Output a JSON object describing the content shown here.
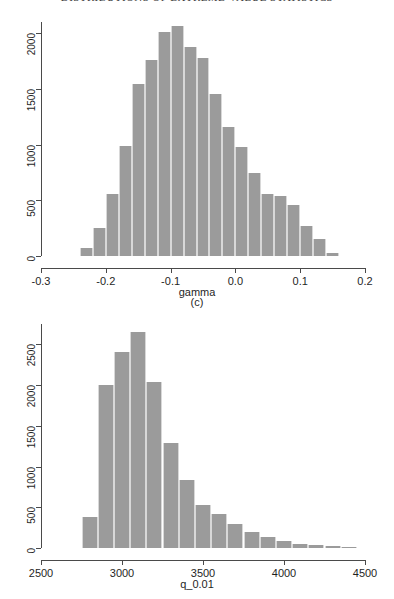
{
  "page": {
    "running_head": "DISTRIBUTIONS OF EXTREME-VALUE STATISTICS"
  },
  "panels": [
    {
      "name": "panel-gamma",
      "caption": "(c)"
    }
  ],
  "chart_data": [
    {
      "type": "bar",
      "subtype": "histogram",
      "title": "",
      "xlabel": "gamma",
      "ylabel": "",
      "xlim": [
        -0.3,
        0.2
      ],
      "ylim": [
        0,
        2100
      ],
      "xticks": [
        -0.3,
        -0.2,
        -0.1,
        0.0,
        0.1,
        0.2
      ],
      "xticklabels": [
        "-0.3",
        "-0.2",
        "-0.1",
        "0.0",
        "0.1",
        "0.2"
      ],
      "yticks": [
        0,
        500,
        1000,
        1500,
        2000
      ],
      "yticklabels": [
        "0",
        "500",
        "1000",
        "1500",
        "2000"
      ],
      "grid": false,
      "legend": null,
      "bin_width": 0.02,
      "bin_edges": [
        -0.24,
        -0.22,
        -0.2,
        -0.18,
        -0.16,
        -0.14,
        -0.12,
        -0.1,
        -0.08,
        -0.06,
        -0.04,
        -0.02,
        0.0,
        0.02,
        0.04,
        0.06,
        0.08,
        0.1,
        0.12,
        0.14,
        0.16
      ],
      "categories": [
        "-0.23",
        "-0.21",
        "-0.19",
        "-0.17",
        "-0.15",
        "-0.13",
        "-0.11",
        "-0.09",
        "-0.07",
        "-0.05",
        "-0.03",
        "-0.01",
        "0.01",
        "0.03",
        "0.05",
        "0.07",
        "0.09",
        "0.11",
        "0.13",
        "0.15"
      ],
      "values": [
        75,
        250,
        560,
        990,
        1545,
        1760,
        2010,
        2065,
        1880,
        1780,
        1450,
        1155,
        980,
        745,
        560,
        535,
        455,
        270,
        150,
        25
      ]
    },
    {
      "type": "bar",
      "subtype": "histogram",
      "title": "",
      "xlabel": "q_0.01",
      "ylabel": "",
      "xlim": [
        2500,
        4500
      ],
      "ylim": [
        0,
        2750
      ],
      "xticks": [
        2500,
        3000,
        3500,
        4000,
        4500
      ],
      "xticklabels": [
        "2500",
        "3000",
        "3500",
        "4000",
        "4500"
      ],
      "yticks": [
        0,
        500,
        1000,
        1500,
        2000,
        2500
      ],
      "yticklabels": [
        "0",
        "500",
        "1000",
        "1500",
        "2000",
        "2500"
      ],
      "grid": false,
      "legend": null,
      "bin_width": 100,
      "bin_edges": [
        2750,
        2850,
        2950,
        3050,
        3150,
        3250,
        3350,
        3450,
        3550,
        3650,
        3750,
        3850,
        3950,
        4050,
        4150,
        4250,
        4350,
        4450
      ],
      "categories": [
        "2800",
        "2900",
        "3000",
        "3100",
        "3200",
        "3300",
        "3400",
        "3500",
        "3600",
        "3700",
        "3800",
        "3900",
        "4000",
        "4100",
        "4200",
        "4300",
        "4400"
      ],
      "values": [
        375,
        2000,
        2410,
        2650,
        2040,
        1290,
        840,
        530,
        420,
        295,
        195,
        140,
        85,
        55,
        35,
        20,
        8
      ]
    }
  ]
}
